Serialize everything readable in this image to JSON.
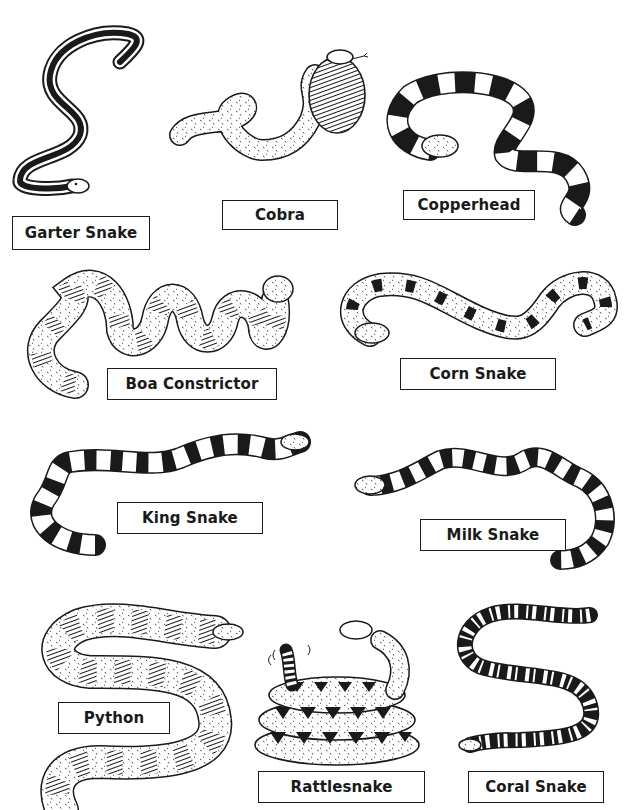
{
  "page": {
    "type": "snake identification worksheet",
    "background": "#ffffff",
    "ink": "#1a1a1a"
  },
  "snakes": [
    {
      "id": "garter",
      "label": "Garter Snake",
      "pattern": "stripe"
    },
    {
      "id": "cobra",
      "label": "Cobra",
      "pattern": "hood-bands"
    },
    {
      "id": "copperhead",
      "label": "Copperhead",
      "pattern": "wide-bands"
    },
    {
      "id": "boa",
      "label": "Boa Constrictor",
      "pattern": "saddles"
    },
    {
      "id": "corn",
      "label": "Corn Snake",
      "pattern": "blotches"
    },
    {
      "id": "king",
      "label": "King Snake",
      "pattern": "bands"
    },
    {
      "id": "milk",
      "label": "Milk Snake",
      "pattern": "bands"
    },
    {
      "id": "python",
      "label": "Python",
      "pattern": "blotches"
    },
    {
      "id": "rattlesnake",
      "label": "Rattlesnake",
      "pattern": "diamonds"
    },
    {
      "id": "coral",
      "label": "Coral Snake",
      "pattern": "rings"
    }
  ]
}
